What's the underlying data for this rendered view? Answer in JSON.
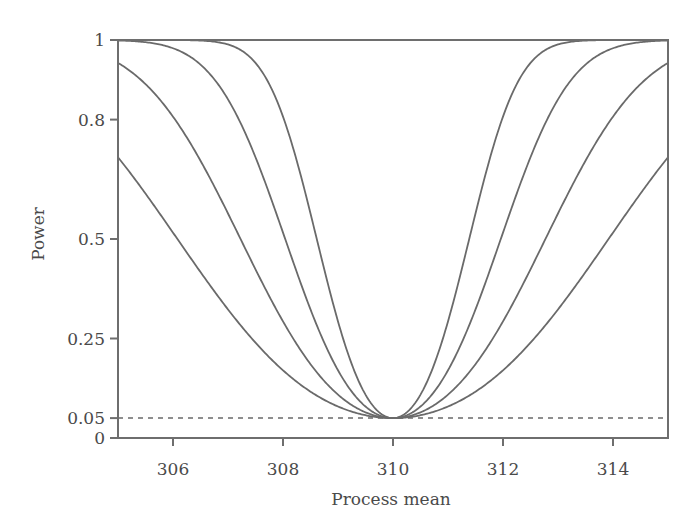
{
  "chart_data": {
    "type": "line",
    "title": "",
    "xlabel": "Process mean",
    "ylabel": "Power",
    "xlim": [
      305,
      315
    ],
    "ylim": [
      0,
      1
    ],
    "x_ticks": [
      306,
      308,
      310,
      312,
      314
    ],
    "x_tick_labels": [
      "306",
      "308",
      "310",
      "312",
      "314"
    ],
    "y_ticks": [
      0,
      0.05,
      0.25,
      0.5,
      0.8,
      1
    ],
    "y_tick_labels": [
      "0",
      "0.05",
      "0.25",
      "0.5",
      "0.8",
      "1"
    ],
    "grid": false,
    "legend": null,
    "reference_line": {
      "y": 0.05,
      "style": "dashed"
    },
    "x": [
      305,
      305.5,
      306,
      306.5,
      307,
      307.5,
      308,
      308.5,
      309,
      309.5,
      310,
      310.5,
      311,
      311.5,
      312,
      312.5,
      313,
      313.5,
      314,
      314.5,
      315
    ],
    "series": [
      {
        "name": "curve 1 (smallest n)",
        "values": [
          0.705,
          0.629,
          0.516,
          0.4,
          0.293,
          0.201,
          0.129,
          0.087,
          0.079,
          0.058,
          0.05,
          0.058,
          0.079,
          0.087,
          0.129,
          0.201,
          0.293,
          0.4,
          0.516,
          0.629,
          0.705
        ]
      },
      {
        "name": "curve 2",
        "values": [
          0.943,
          0.881,
          0.789,
          0.667,
          0.525,
          0.38,
          0.248,
          0.144,
          0.079,
          0.06,
          0.05,
          0.06,
          0.079,
          0.144,
          0.248,
          0.38,
          0.525,
          0.667,
          0.789,
          0.881,
          0.943
        ]
      },
      {
        "name": "curve 3",
        "values": [
          0.999,
          0.995,
          0.979,
          0.936,
          0.851,
          0.705,
          0.516,
          0.323,
          0.17,
          0.079,
          0.05,
          0.079,
          0.17,
          0.323,
          0.516,
          0.705,
          0.851,
          0.936,
          0.979,
          0.995,
          0.999
        ]
      },
      {
        "name": "curve 4 (largest n)",
        "values": [
          1.0,
          1.0,
          1.0,
          0.998,
          0.987,
          0.943,
          0.807,
          0.577,
          0.293,
          0.109,
          0.05,
          0.109,
          0.293,
          0.577,
          0.807,
          0.943,
          0.987,
          0.998,
          1.0,
          1.0,
          1.0
        ]
      }
    ],
    "model": {
      "form": "two-sided z-test power",
      "center": 310,
      "alpha": 0.05,
      "scale_factors": [
        0.5,
        0.7071,
        1.0,
        1.4142
      ]
    }
  }
}
